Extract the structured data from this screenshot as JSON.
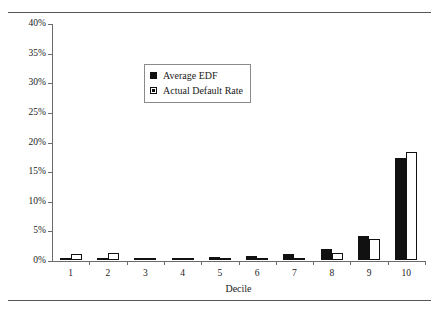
{
  "chart_data": {
    "type": "bar",
    "title": "",
    "subtitle": "",
    "xlabel": "Decile",
    "ylabel": "",
    "categories": [
      "1",
      "2",
      "3",
      "4",
      "5",
      "6",
      "7",
      "8",
      "9",
      "10"
    ],
    "series": [
      {
        "name": "Average EDF",
        "color": "#111111",
        "style": "filled",
        "values": [
          0.2,
          0.3,
          0.15,
          0.4,
          0.5,
          0.7,
          1.0,
          1.8,
          4.0,
          17.3
        ]
      },
      {
        "name": "Actual Default Rate",
        "color": "#ffffff",
        "style": "outlined",
        "values": [
          1.0,
          1.2,
          0.1,
          0.2,
          0.2,
          0.3,
          0.3,
          1.2,
          3.5,
          18.3
        ]
      }
    ],
    "ylim": [
      0,
      40
    ],
    "ytick_values": [
      0,
      5,
      10,
      15,
      20,
      25,
      30,
      35,
      40
    ],
    "ytick_labels": [
      "0%",
      "5%",
      "10%",
      "15%",
      "20%",
      "25%",
      "30%",
      "35%",
      "40%"
    ],
    "grid": false,
    "legend_position": "upper-center",
    "units": "percent"
  },
  "legend": {
    "entries": [
      {
        "label": "Average EDF",
        "marker": "filled-square-marker"
      },
      {
        "label": "Actual Default Rate",
        "marker": "outlined-square-marker"
      }
    ]
  },
  "axis": {
    "x_title": "Decile"
  }
}
